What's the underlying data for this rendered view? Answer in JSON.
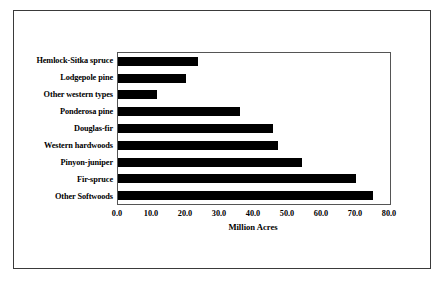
{
  "chart_data": {
    "type": "bar",
    "orientation": "horizontal",
    "title": "",
    "xlabel": "Million Acres",
    "ylabel": "",
    "xlim": [
      0,
      80
    ],
    "xticks": [
      "0.0",
      "10.0",
      "20.0",
      "30.0",
      "40.0",
      "50.0",
      "60.0",
      "70.0",
      "80.0"
    ],
    "xtick_values": [
      0,
      10,
      20,
      30,
      40,
      50,
      60,
      70,
      80
    ],
    "grid": false,
    "legend": false,
    "bar_color": "#000000",
    "categories": [
      "Hemlock-Sitka spruce",
      "Lodgepole pine",
      "Other western types",
      "Ponderosa pine",
      "Douglas-fir",
      "Western hardwoods",
      "Pinyon-juniper",
      "Fir-spruce",
      "Other Softwoods"
    ],
    "values": [
      23.5,
      20.0,
      11.5,
      36.0,
      45.5,
      47.0,
      54.0,
      70.0,
      75.0
    ]
  },
  "figure": {
    "frame_color": "#3a3a3a",
    "plot_border_color": "#555555",
    "background": "#ffffff"
  }
}
